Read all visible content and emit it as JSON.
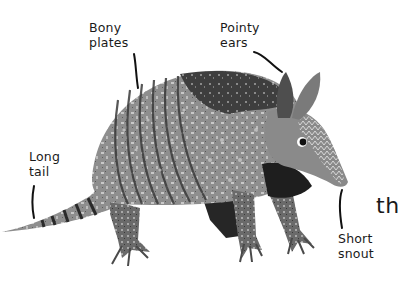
{
  "illustration": {
    "subject": "armadillo",
    "style": "grayscale textured painting",
    "labels": [
      {
        "id": "bony-plates",
        "lines": [
          "Bony",
          "plates"
        ]
      },
      {
        "id": "pointy-ears",
        "lines": [
          "Pointy",
          "ears"
        ]
      },
      {
        "id": "long-tail",
        "lines": [
          "Long",
          "tail"
        ]
      },
      {
        "id": "short-snout",
        "lines": [
          "Short",
          "snout"
        ]
      }
    ],
    "cropped_text": "th"
  },
  "colors": {
    "background": "#ffffff",
    "text": "#1a1a1a",
    "shell_light": "#9a9a9a",
    "shell_dark": "#3c3c3c",
    "head": "#8a8a8a",
    "underside": "#1e1e1e"
  }
}
